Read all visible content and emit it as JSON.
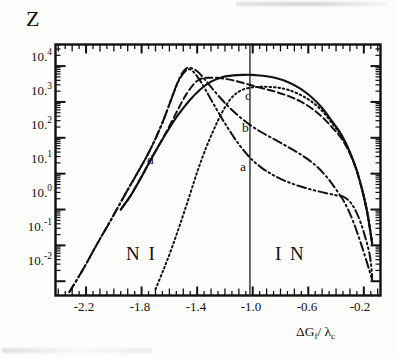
{
  "figure": {
    "kind": "scanned-scientific-plot",
    "ylabel": "Z",
    "xlabel_main": "ΔG",
    "xlabel_sub1": "f",
    "xlabel_mid": "/ λ",
    "xlabel_sub2": "c"
  },
  "axes": {
    "y_tick_labels": [
      {
        "mantissa": "10.",
        "exp": "4",
        "value": 10000
      },
      {
        "mantissa": "10.",
        "exp": "3",
        "value": 1000
      },
      {
        "mantissa": "10.",
        "exp": "2",
        "value": 100
      },
      {
        "mantissa": "10.",
        "exp": "1",
        "value": 10
      },
      {
        "mantissa": "10.",
        "exp": "0",
        "value": 1
      },
      {
        "mantissa": "10.",
        "exp": "-1",
        "value": 0.1
      },
      {
        "mantissa": "10.",
        "exp": "-2",
        "value": 0.01
      }
    ],
    "x_tick_labels": [
      "-2.2",
      "-1.8",
      "-1.4",
      "-1.0",
      "-0.6",
      "-0.2"
    ],
    "x_tick_values": [
      -2.2,
      -1.8,
      -1.4,
      -1.0,
      -0.6,
      -0.2
    ]
  },
  "regions": [
    {
      "name": "region-NI",
      "text": "N I"
    },
    {
      "name": "region-IN",
      "text": "I N"
    }
  ],
  "curve_labels": [
    {
      "name": "curve-label-a",
      "text": "a"
    },
    {
      "name": "curve-label-b",
      "text": "b"
    },
    {
      "name": "curve-label-c",
      "text": "c"
    },
    {
      "name": "curve-label-d",
      "text": "d"
    }
  ],
  "colors": {
    "ink": "#111111",
    "paper": "#fdfdfc",
    "divider": "#3a3a3a"
  },
  "chart_data": {
    "type": "line",
    "title": "",
    "xlabel": "ΔG_f / λ_c",
    "ylabel": "Z",
    "yscale": "log",
    "xlim": [
      -2.42,
      -0.08
    ],
    "ylim": [
      0.004,
      40000
    ],
    "grid": false,
    "legend": "inline-curve-labels",
    "ytick_values": [
      10000,
      1000,
      100,
      10,
      1,
      0.1,
      0.01
    ],
    "ytick_text": [
      "10^4",
      "10^3",
      "10^2",
      "10^1",
      "10^0",
      "10^-1",
      "10^-2"
    ],
    "xtick_values": [
      -2.2,
      -1.8,
      -1.4,
      -1.0,
      -0.6,
      -0.2
    ],
    "xtick_text": [
      "-2.2",
      "-1.8",
      "-1.4",
      "-1.0",
      "-0.6",
      "-0.2"
    ],
    "annotations": [
      {
        "text": "N I",
        "x": -1.62,
        "y": 0.018
      },
      {
        "text": "I N",
        "x": -0.44,
        "y": 0.018
      },
      {
        "text": "a",
        "x": -0.92,
        "y": 7.0
      },
      {
        "text": "b",
        "x": -0.88,
        "y": 95
      },
      {
        "text": "c",
        "x": -0.86,
        "y": 760
      },
      {
        "text": "d",
        "x": -1.46,
        "y": 8.5
      }
    ],
    "vertical_line": {
      "x": -1.02,
      "label": "NI/IN boundary"
    },
    "series": [
      {
        "name": "solid",
        "label": "",
        "style": "solid",
        "x": [
          -1.95,
          -1.88,
          -1.82,
          -1.76,
          -1.7,
          -1.62,
          -1.54,
          -1.46,
          -1.38,
          -1.3,
          -1.22,
          -1.14,
          -1.06,
          -1.02,
          -0.98,
          -0.9,
          -0.82,
          -0.74,
          -0.66,
          -0.58,
          -0.5,
          -0.42,
          -0.36,
          -0.3,
          -0.24,
          -0.18,
          -0.14
        ],
        "y": [
          1.0,
          2.4,
          6.0,
          16.0,
          42.0,
          140.0,
          420.0,
          1050.0,
          2200.0,
          3700.0,
          4900.0,
          5500.0,
          5700.0,
          5700.0,
          5600.0,
          5200.0,
          4500.0,
          3500.0,
          2400.0,
          1400.0,
          680.0,
          260.0,
          120.0,
          40.0,
          9.0,
          1.0,
          0.11
        ]
      },
      {
        "name": "curve-d",
        "label": "d",
        "style": "dotted",
        "x": [
          -1.7,
          -1.64,
          -1.58,
          -1.52,
          -1.46,
          -1.4,
          -1.34,
          -1.28,
          -1.22,
          -1.16,
          -1.1,
          -1.04,
          -0.98,
          -0.92,
          -0.86,
          -0.8,
          -0.74,
          -0.66,
          -0.58,
          -0.5,
          -0.42,
          -0.36,
          -0.3,
          -0.24,
          -0.18,
          -0.14
        ],
        "y": [
          0.006,
          0.022,
          0.09,
          0.42,
          2.1,
          11.0,
          48.0,
          170.0,
          520.0,
          1200.0,
          1950.0,
          2400.0,
          2600.0,
          2650.0,
          2600.0,
          2450.0,
          2150.0,
          1600.0,
          1050.0,
          560.0,
          230.0,
          110.0,
          38.0,
          9.0,
          1.1,
          0.12
        ]
      },
      {
        "name": "curve-c",
        "label": "c",
        "style": "dashed",
        "x": [
          -1.95,
          -1.88,
          -1.82,
          -1.76,
          -1.7,
          -1.62,
          -1.54,
          -1.48,
          -1.42,
          -1.38,
          -1.34,
          -1.3,
          -1.26,
          -1.2,
          -1.14,
          -1.06,
          -0.98,
          -0.9,
          -0.82,
          -0.74,
          -0.66,
          -0.58,
          -0.5,
          -0.42,
          -0.36,
          -0.3,
          -0.24,
          -0.18,
          -0.14
        ],
        "y": [
          1.0,
          2.4,
          6.0,
          16.0,
          42.0,
          150.0,
          600.0,
          1600.0,
          3300.0,
          4300.0,
          4700.0,
          4750.0,
          4700.0,
          4400.0,
          4000.0,
          3300.0,
          2700.0,
          2250.0,
          1850.0,
          1450.0,
          1050.0,
          680.0,
          380.0,
          180.0,
          95.0,
          36.0,
          8.5,
          1.0,
          0.11
        ]
      },
      {
        "name": "curve-b",
        "label": "b",
        "style": "dash-dot",
        "x": [
          -2.32,
          -2.22,
          -2.12,
          -2.02,
          -1.92,
          -1.84,
          -1.76,
          -1.7,
          -1.64,
          -1.58,
          -1.54,
          -1.5,
          -1.46,
          -1.4,
          -1.34,
          -1.26,
          -1.18,
          -1.1,
          -1.02,
          -0.94,
          -0.86,
          -0.78,
          -0.7,
          -0.62,
          -0.54,
          -0.46,
          -0.4,
          -0.34,
          -0.28,
          -0.22,
          -0.16,
          -0.14
        ],
        "y": [
          0.005,
          0.022,
          0.11,
          0.52,
          2.6,
          9.0,
          32.0,
          95.0,
          330.0,
          1400.0,
          3600.0,
          7000.0,
          9000.0,
          7200.0,
          4000.0,
          1700.0,
          780.0,
          400.0,
          230.0,
          145.0,
          98.0,
          66.0,
          44.0,
          28.0,
          16.0,
          7.5,
          3.6,
          1.6,
          0.5,
          0.11,
          0.02,
          0.011
        ]
      },
      {
        "name": "curve-a",
        "label": "a",
        "style": "dash-dot-dot",
        "x": [
          -2.32,
          -2.22,
          -2.12,
          -2.02,
          -1.92,
          -1.84,
          -1.76,
          -1.7,
          -1.64,
          -1.58,
          -1.52,
          -1.46,
          -1.4,
          -1.34,
          -1.26,
          -1.18,
          -1.1,
          -1.02,
          -0.94,
          -0.86,
          -0.78,
          -0.7,
          -0.62,
          -0.54,
          -0.46,
          -0.4,
          -0.34,
          -0.28,
          -0.22,
          -0.16,
          -0.14
        ],
        "y": [
          0.005,
          0.022,
          0.11,
          0.52,
          2.6,
          9.0,
          32.0,
          95.0,
          330.0,
          1400.0,
          4800.0,
          8200.0,
          5200.0,
          2200.0,
          620.0,
          190.0,
          66.0,
          28.0,
          15.0,
          9.5,
          6.6,
          5.0,
          4.0,
          3.3,
          2.8,
          2.5,
          2.2,
          1.3,
          0.4,
          0.06,
          0.013
        ]
      }
    ]
  }
}
